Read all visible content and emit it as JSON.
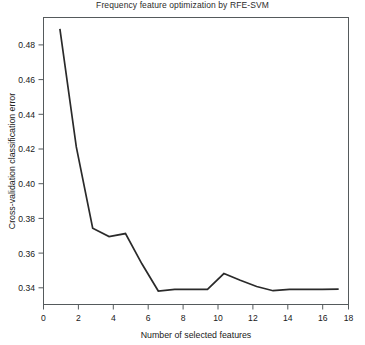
{
  "chart_data": {
    "type": "line",
    "title": "Frequency feature optimization by RFE-SVM",
    "xlabel": "Number of selected features",
    "ylabel": "Cross-validation classification error",
    "x": [
      1,
      2,
      3,
      4,
      5,
      6,
      7,
      8,
      9,
      10,
      11,
      12,
      13,
      14,
      15,
      16,
      17,
      18
    ],
    "values": [
      0.4908,
      0.4205,
      0.3722,
      0.3672,
      0.369,
      0.351,
      0.3348,
      0.3358,
      0.3358,
      0.3358,
      0.3452,
      0.3412,
      0.3375,
      0.335,
      0.3358,
      0.3358,
      0.3358,
      0.336
    ],
    "series": [
      {
        "name": "Cross-validation classification error",
        "values": [
          0.4908,
          0.4205,
          0.3722,
          0.3672,
          0.369,
          0.351,
          0.3348,
          0.3358,
          0.3358,
          0.3358,
          0.3452,
          0.3412,
          0.3375,
          0.335,
          0.3358,
          0.3358,
          0.3358,
          0.336
        ]
      }
    ],
    "xlim": [
      0,
      18.6
    ],
    "ylim": [
      0.3268,
      0.4975
    ],
    "xticks": [
      0,
      2,
      4,
      6,
      8,
      10,
      12,
      14,
      16,
      18
    ],
    "xtick_labels": [
      "0",
      "2",
      "4",
      "6",
      "8",
      "10",
      "12",
      "14",
      "16",
      "18"
    ],
    "yticks": [
      0.34,
      0.36,
      0.38,
      0.4,
      0.42,
      0.44,
      0.46,
      0.48
    ],
    "ytick_labels": [
      "0.34",
      "0.36",
      "0.38",
      "0.40",
      "0.42",
      "0.44",
      "0.46",
      "0.48"
    ],
    "grid": false,
    "legend": null,
    "line_color": "#2a2a2a",
    "frame_color": "#555a5c"
  }
}
